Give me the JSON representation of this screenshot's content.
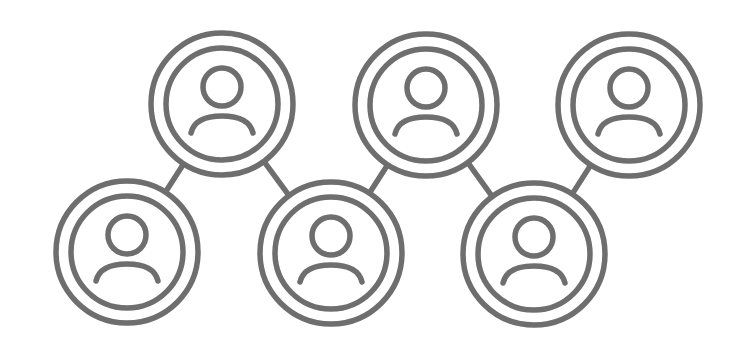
{
  "diagram": {
    "type": "network",
    "colors": {
      "stroke": "#6e6e6e",
      "background": "#ffffff"
    },
    "nodes": [
      {
        "id": "n1",
        "icon": "user-icon",
        "x": 127,
        "y": 252
      },
      {
        "id": "n2",
        "icon": "user-icon",
        "x": 222,
        "y": 104
      },
      {
        "id": "n3",
        "icon": "user-icon",
        "x": 331,
        "y": 253
      },
      {
        "id": "n4",
        "icon": "user-icon",
        "x": 426,
        "y": 105
      },
      {
        "id": "n5",
        "icon": "user-icon",
        "x": 534,
        "y": 254
      },
      {
        "id": "n6",
        "icon": "user-icon",
        "x": 629,
        "y": 105
      }
    ],
    "edges": [
      [
        "n1",
        "n2"
      ],
      [
        "n2",
        "n3"
      ],
      [
        "n3",
        "n4"
      ],
      [
        "n4",
        "n5"
      ],
      [
        "n5",
        "n6"
      ]
    ]
  }
}
